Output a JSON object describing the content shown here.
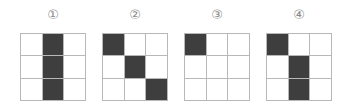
{
  "figures": [
    {
      "label": "①",
      "cells": [
        [
          0,
          1,
          0
        ],
        [
          0,
          1,
          0
        ],
        [
          0,
          1,
          0
        ]
      ]
    },
    {
      "label": "②",
      "cells": [
        [
          1,
          0,
          0
        ],
        [
          0,
          1,
          0
        ],
        [
          0,
          0,
          1
        ]
      ]
    },
    {
      "label": "③",
      "cells": [
        [
          1,
          0,
          0
        ],
        [
          0,
          0,
          0
        ],
        [
          0,
          0,
          0
        ]
      ]
    },
    {
      "label": "④",
      "cells": [
        [
          1,
          0,
          0
        ],
        [
          0,
          1,
          0
        ],
        [
          0,
          1,
          0
        ]
      ]
    }
  ],
  "colors": {
    "filled": "#3e3e3e",
    "empty": "#ffffff",
    "gridline": "#b8b8b8",
    "label": "#8a8a8a"
  }
}
